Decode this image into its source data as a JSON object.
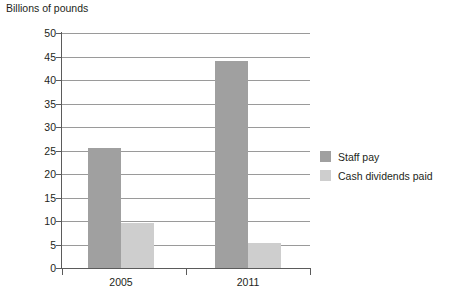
{
  "chart_data": {
    "type": "bar",
    "title": "Billions of pounds",
    "subtitle": "",
    "xlabel": "",
    "ylabel": "",
    "categories": [
      "2005",
      "2011"
    ],
    "series": [
      {
        "name": "Staff pay",
        "values": [
          25.5,
          44.0
        ],
        "color": "#a0a0a0"
      },
      {
        "name": "Cash dividends paid",
        "values": [
          9.5,
          5.3
        ],
        "color": "#cecece"
      }
    ],
    "ylim": [
      0,
      50
    ],
    "ytick_step": 5,
    "yticks": [
      "50",
      "45",
      "40",
      "35",
      "30",
      "25",
      "20",
      "15",
      "10",
      "5",
      "0"
    ],
    "grid": true,
    "grid_axis": "y",
    "legend_position": "right",
    "axis_color": "#5b5b5b",
    "grid_color": "#9a9a9a",
    "background": "#ffffff"
  },
  "legend": {
    "entries": [
      {
        "label": "Staff pay",
        "color": "#a0a0a0"
      },
      {
        "label": "Cash dividends paid",
        "color": "#cecece"
      }
    ]
  }
}
